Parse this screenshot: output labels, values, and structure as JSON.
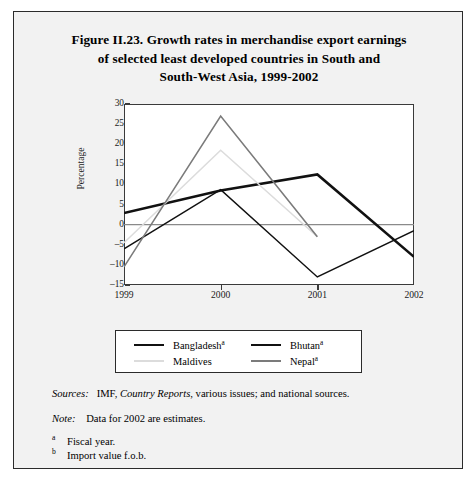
{
  "figure": {
    "title_lines": [
      "Figure II.23.  Growth rates in merchandise export earnings",
      "of selected least developed countries in South and",
      "South-West Asia, 1999-2002"
    ]
  },
  "chart_data": {
    "type": "line",
    "title": "Figure II.23.  Growth rates in merchandise export earnings of selected least developed countries in South and South-West Asia, 1999-2002",
    "xlabel": "",
    "ylabel": "Percentage",
    "categories": [
      "1999",
      "2000",
      "2001",
      "2002"
    ],
    "x": [
      1999,
      2000,
      2001,
      2002
    ],
    "ylim": [
      -15,
      30
    ],
    "yticks": [
      30,
      25,
      20,
      15,
      10,
      5,
      0,
      -5,
      -10,
      -15
    ],
    "ytick_labels": [
      "30",
      "25",
      "20",
      "15",
      "10",
      "5",
      "0",
      "-5",
      "-10",
      "-15"
    ],
    "xtick_labels": [
      "1999",
      "2000",
      "2001",
      "2002"
    ],
    "grid": false,
    "zero_line": true,
    "legend_position": "bottom",
    "series": [
      {
        "name": "Bangladesh",
        "footnote": "a",
        "color": "#111111",
        "width": 2.6,
        "values": [
          2.9,
          8.5,
          12.5,
          -8.0
        ]
      },
      {
        "name": "Bhutan",
        "footnote": "a",
        "color": "#111111",
        "width": 1.5,
        "values": [
          -6.0,
          8.7,
          -13.0,
          -1.5
        ]
      },
      {
        "name": "Maldives",
        "footnote": "",
        "color": "#dcdcdc",
        "width": 1.6,
        "values": [
          -4.5,
          18.5,
          -3.0,
          null
        ]
      },
      {
        "name": "Nepal",
        "footnote": "a",
        "color": "#7b7b7b",
        "width": 1.6,
        "values": [
          -10.5,
          27.0,
          -3.0,
          null
        ]
      }
    ]
  },
  "legend": {
    "entries": [
      {
        "label": "Bangladesh",
        "footnote": "a"
      },
      {
        "label": "Bhutan",
        "footnote": "a"
      },
      {
        "label": "Maldives",
        "footnote": ""
      },
      {
        "label": "Nepal",
        "footnote": "a"
      }
    ]
  },
  "notes": {
    "sources_lead": "Sources:",
    "sources_text": "IMF, Country Reports, various issues; and national sources.",
    "note_lead": "Note:",
    "note_text": "Data for 2002 are estimates.",
    "footnotes": [
      {
        "marker": "a",
        "text": "Fiscal year."
      },
      {
        "marker": "b",
        "text": "Import value f.o.b."
      }
    ]
  },
  "colors": {
    "page_background": "#f2f2f2",
    "plot_background": "#ffffff",
    "frame": "#2b2b2b",
    "axis": "#3a3a3a",
    "zero_line": "#8a8a8a"
  }
}
